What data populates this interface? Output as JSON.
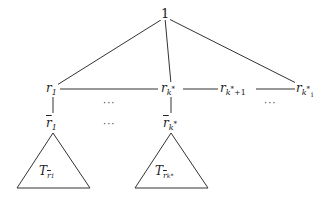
{
  "diagram": {
    "root": {
      "label": "1"
    },
    "level1": [
      {
        "id": "r1",
        "base": "r",
        "sub": "1"
      },
      {
        "id": "rk",
        "base": "r",
        "sub": "k",
        "sup": "*"
      },
      {
        "id": "rk1",
        "base": "r",
        "sub": "k",
        "sup": "*",
        "tail": "+1"
      },
      {
        "id": "rki",
        "base": "r",
        "sub": "k",
        "sup": "*",
        "subsub": "i"
      }
    ],
    "level2": [
      {
        "id": "rbar1",
        "base": "r",
        "sub": "1"
      },
      {
        "id": "rbark",
        "base": "r",
        "sub": "k",
        "sup": "*"
      }
    ],
    "subtrees": [
      {
        "id": "T1",
        "base": "T",
        "sub": "r1"
      },
      {
        "id": "Tk",
        "base": "T",
        "sub": "rk*"
      }
    ],
    "ellipsis": "···",
    "edges": [
      [
        "1",
        "r1"
      ],
      [
        "1",
        "rk"
      ],
      [
        "1",
        "rki"
      ],
      [
        "r1",
        "rk"
      ],
      [
        "rk",
        "rk1"
      ],
      [
        "rk1",
        "rki"
      ],
      [
        "r1",
        "rbar1"
      ],
      [
        "rk",
        "rbark"
      ]
    ],
    "colors": {
      "stroke": "#333333",
      "text": "#222222",
      "background": "#ffffff"
    }
  }
}
